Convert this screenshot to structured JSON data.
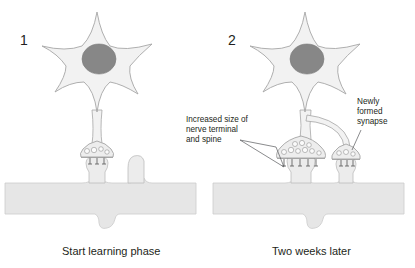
{
  "figure": {
    "background_color": "#ffffff",
    "text_color": "#231f20"
  },
  "panels": [
    {
      "number": "1",
      "caption": "Start learning phase",
      "synapse_count": 1,
      "vesicle_count": 4,
      "receptor_count": 3,
      "annotations": []
    },
    {
      "number": "2",
      "caption": "Two weeks later",
      "synapse_count": 2,
      "vesicle_count": 11,
      "receptor_count": 6,
      "annotations": [
        {
          "id": "increased-size",
          "lines": [
            "Increased size of",
            "nerve terminal",
            "and spine"
          ]
        },
        {
          "id": "newly-formed",
          "lines": [
            "Newly",
            "formed",
            "synapse"
          ]
        }
      ]
    }
  ],
  "colors": {
    "cell_body_fill": "#f2f2f2",
    "cell_body_stroke": "#a6a6a6",
    "nucleus_fill": "#878787",
    "dendrite_fill": "#e6e6e6",
    "dendrite_stroke": "#cccccc",
    "terminal_fill": "#ededed",
    "leader_line": "#58595b"
  },
  "labels": {
    "panel_one_number": "1",
    "panel_two_number": "2",
    "panel_one_caption": "Start learning phase",
    "panel_two_caption": "Two weeks later",
    "ann_inc_line1": "Increased size of",
    "ann_inc_line2": "nerve terminal",
    "ann_inc_line3": "and spine",
    "ann_new_line1": "Newly",
    "ann_new_line2": "formed",
    "ann_new_line3": "synapse"
  }
}
